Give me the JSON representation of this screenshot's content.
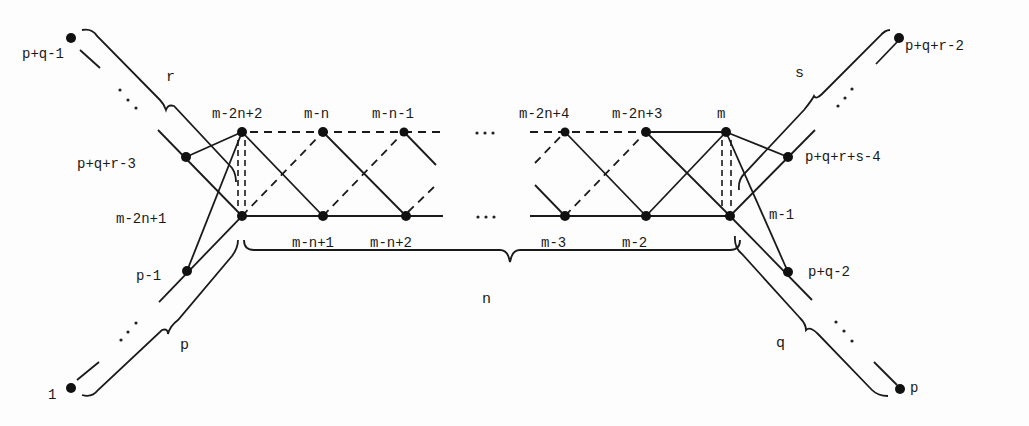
{
  "figure": {
    "type": "graph-diagram"
  },
  "nodes": {
    "top_row": [
      {
        "id": "m-2n+2",
        "label": "m-2n+2"
      },
      {
        "id": "m-n",
        "label": "m-n"
      },
      {
        "id": "m-n-1",
        "label": "m-n-1"
      },
      {
        "id": "m-2n+4",
        "label": "m-2n+4"
      },
      {
        "id": "m-2n+3",
        "label": "m-2n+3"
      },
      {
        "id": "m",
        "label": "m"
      }
    ],
    "bottom_row": [
      {
        "id": "m-2n+1",
        "label": "m-2n+1"
      },
      {
        "id": "m-n+1",
        "label": "m-n+1"
      },
      {
        "id": "m-n+2",
        "label": "m-n+2"
      },
      {
        "id": "m-3",
        "label": "m-3"
      },
      {
        "id": "m-2",
        "label": "m-2"
      },
      {
        "id": "m-1",
        "label": "m-1"
      }
    ],
    "left_chain": [
      {
        "id": "p+q-1",
        "label": "p+q-1"
      },
      {
        "id": "p+q+r-3",
        "label": "p+q+r-3"
      },
      {
        "id": "p-1",
        "label": "p-1"
      },
      {
        "id": "1",
        "label": "1"
      }
    ],
    "right_chain": [
      {
        "id": "p+q+r-2",
        "label": "p+q+r-2"
      },
      {
        "id": "p+q+r+s-4",
        "label": "p+q+r+s-4"
      },
      {
        "id": "p+q-2",
        "label": "p+q-2"
      },
      {
        "id": "p",
        "label": "p"
      }
    ]
  },
  "braces": {
    "top_left": "r",
    "bottom_left": "p",
    "top_right": "s",
    "bottom_right": "q",
    "bottom_center": "n"
  },
  "ellipses": {
    "top_row": "...",
    "bottom_row": "...,",
    "chain": "..."
  }
}
